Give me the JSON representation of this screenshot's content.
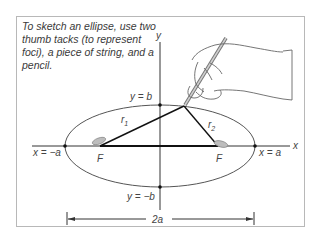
{
  "caption": "To sketch an ellipse, use two thumb tacks (to represent foci), a piece of string, and a pencil.",
  "axes": {
    "x_label": "x",
    "y_label": "y"
  },
  "labels": {
    "top_vertex": "y = b",
    "bottom_vertex": "y = −b",
    "left_vertex": "x = −a",
    "right_vertex": "x = a",
    "focus_left": "F",
    "focus_right": "F",
    "r1": "r",
    "r1_sub": "1",
    "r2": "r",
    "r2_sub": "2",
    "major_axis": "2a"
  },
  "colors": {
    "line": "#1a1a1a",
    "ellipse": "#555555",
    "tack": "#b5b5b5",
    "frame": "#b8b8b8",
    "text": "#444444"
  }
}
